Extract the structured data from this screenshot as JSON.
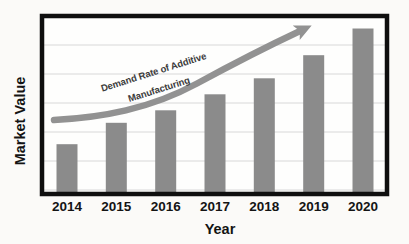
{
  "figure": {
    "background": "#fbfaf8",
    "plot_background": "#fefefd",
    "frame_color": "#0f0f0f",
    "grid_color": "#d8d8d8",
    "text_color": "#141414"
  },
  "chart_data": {
    "type": "bar",
    "title": "",
    "xlabel": "Year",
    "ylabel": "Market Value",
    "categories": [
      "2014",
      "2015",
      "2016",
      "2017",
      "2018",
      "2019",
      "2020"
    ],
    "values": [
      28,
      40,
      47,
      56,
      65,
      78,
      93
    ],
    "ylim": [
      0,
      100
    ],
    "y_tick_labels_visible": false,
    "grid": "horizontal",
    "gridline_count": 6,
    "legend_position": "none",
    "bar_color": "#8b8b8b",
    "annotation": {
      "line1": "Demand Rate of Additive",
      "line2": "Manufacturing",
      "arrow_color": "#929292",
      "text_color": "#3c3c3c",
      "shape": "curved-arrow-up-right"
    }
  }
}
